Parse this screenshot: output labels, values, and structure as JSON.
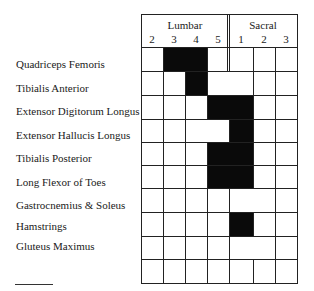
{
  "header": {
    "groups": [
      {
        "label": "Lumbar"
      },
      {
        "label": "Sacral"
      }
    ],
    "segments": [
      "2",
      "3",
      "4",
      "5",
      "1",
      "2",
      "3"
    ]
  },
  "rows": [
    {
      "label": "Quadriceps Femoris"
    },
    {
      "label": "Tibialis Anterior"
    },
    {
      "label": "Extensor Digitorum Longus"
    },
    {
      "label": "Extensor Hallucis Longus"
    },
    {
      "label": "Tibialis Posterior"
    },
    {
      "label": "Long Flexor of Toes"
    },
    {
      "label": "Gastrocnemius & Soleus"
    },
    {
      "label": "Hamstrings"
    },
    {
      "label": "Gluteus Maximus"
    },
    {
      "label": ""
    }
  ],
  "chart_data": {
    "type": "table",
    "columns": [
      "L2",
      "L3",
      "L4",
      "L5",
      "S1",
      "S2",
      "S3"
    ],
    "column_groups": [
      {
        "name": "Lumbar",
        "columns": [
          "L2",
          "L3",
          "L4",
          "L5"
        ]
      },
      {
        "name": "Sacral",
        "columns": [
          "S1",
          "S2",
          "S3"
        ]
      }
    ],
    "rows": [
      {
        "muscle": "Quadriceps Femoris",
        "segments": [
          "L3",
          "L4"
        ]
      },
      {
        "muscle": "Tibialis Anterior",
        "segments": [
          "L4"
        ]
      },
      {
        "muscle": "Extensor Digitorum Longus",
        "segments": [
          "L5",
          "S1"
        ]
      },
      {
        "muscle": "Extensor Hallucis Longus",
        "segments": [
          "S1"
        ]
      },
      {
        "muscle": "Tibialis Posterior",
        "segments": [
          "L5",
          "S1"
        ]
      },
      {
        "muscle": "Long Flexor of Toes",
        "segments": [
          "L5",
          "S1"
        ]
      },
      {
        "muscle": "Gastrocnemius & Soleus",
        "segments": []
      },
      {
        "muscle": "Hamstrings",
        "segments": [
          "S1"
        ]
      },
      {
        "muscle": "Gluteus Maximus",
        "segments": []
      },
      {
        "muscle": "",
        "segments": []
      }
    ],
    "matrix": [
      [
        0,
        1,
        1,
        0,
        0,
        0,
        0
      ],
      [
        0,
        0,
        1,
        0,
        0,
        0,
        0
      ],
      [
        0,
        0,
        0,
        1,
        1,
        0,
        0
      ],
      [
        0,
        0,
        0,
        0,
        1,
        0,
        0
      ],
      [
        0,
        0,
        0,
        1,
        1,
        0,
        0
      ],
      [
        0,
        0,
        0,
        1,
        1,
        0,
        0
      ],
      [
        0,
        0,
        0,
        0,
        0,
        0,
        0
      ],
      [
        0,
        0,
        0,
        0,
        1,
        0,
        0
      ],
      [
        0,
        0,
        0,
        0,
        0,
        0,
        0
      ],
      [
        0,
        0,
        0,
        0,
        0,
        0,
        0
      ]
    ],
    "merged_white_cells": [
      {
        "row": 1,
        "cols": [
          3,
          4
        ]
      },
      {
        "row": 3,
        "cols": [
          2,
          3
        ]
      },
      {
        "row": 6,
        "cols": [
          4,
          5
        ]
      },
      {
        "row": 8,
        "cols": [
          4,
          5
        ]
      }
    ],
    "colors": {
      "filled": "#0a0a0a",
      "empty": "#ffffff",
      "grid": "#222222"
    }
  }
}
